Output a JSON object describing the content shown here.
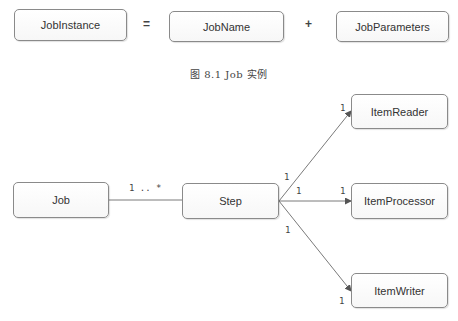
{
  "equation": {
    "lhs": "JobInstance",
    "equals": "=",
    "term1": "JobName",
    "plus": "+",
    "term2": "JobParameters"
  },
  "caption": "图 8.1   Job 实例",
  "diagram": {
    "nodes": {
      "job": "Job",
      "step": "Step",
      "reader": "ItemReader",
      "processor": "ItemProcessor",
      "writer": "ItemWriter"
    },
    "edges": [
      {
        "from": "Job",
        "to": "Step",
        "label": "1 .. *"
      },
      {
        "from": "Step",
        "to": "ItemReader",
        "source_mult": "1",
        "target_mult": "1"
      },
      {
        "from": "Step",
        "to": "ItemProcessor",
        "source_mult": "1",
        "target_mult": "1"
      },
      {
        "from": "Step",
        "to": "ItemWriter",
        "source_mult": "1",
        "target_mult": "1"
      }
    ]
  },
  "colors": {
    "line": "#7a7a7a",
    "border": "#8a8a8a",
    "text": "#333333"
  }
}
